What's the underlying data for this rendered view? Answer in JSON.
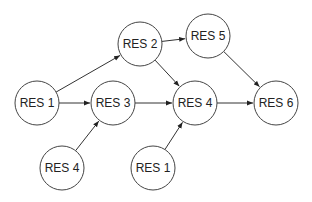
{
  "diagram": {
    "type": "directed-graph",
    "nodes": [
      {
        "id": "n_res2",
        "label": "RES 2",
        "x": 140,
        "y": 44
      },
      {
        "id": "n_res5",
        "label": "RES 5",
        "x": 208,
        "y": 36
      },
      {
        "id": "n_res1a",
        "label": "RES 1",
        "x": 37,
        "y": 103
      },
      {
        "id": "n_res3",
        "label": "RES 3",
        "x": 113,
        "y": 103
      },
      {
        "id": "n_res4a",
        "label": "RES 4",
        "x": 195,
        "y": 103
      },
      {
        "id": "n_res6",
        "label": "RES 6",
        "x": 276,
        "y": 103
      },
      {
        "id": "n_res4b",
        "label": "RES 4",
        "x": 62,
        "y": 168
      },
      {
        "id": "n_res1b",
        "label": "RES 1",
        "x": 153,
        "y": 168
      }
    ],
    "edges": [
      {
        "from": "n_res1a",
        "to": "n_res2"
      },
      {
        "from": "n_res1a",
        "to": "n_res3"
      },
      {
        "from": "n_res2",
        "to": "n_res5"
      },
      {
        "from": "n_res2",
        "to": "n_res4a"
      },
      {
        "from": "n_res3",
        "to": "n_res4a"
      },
      {
        "from": "n_res4b",
        "to": "n_res3"
      },
      {
        "from": "n_res1b",
        "to": "n_res4a"
      },
      {
        "from": "n_res4a",
        "to": "n_res6"
      },
      {
        "from": "n_res5",
        "to": "n_res6"
      }
    ],
    "node_radius": 22
  }
}
